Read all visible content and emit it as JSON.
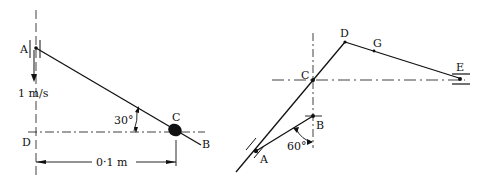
{
  "figure_left": {
    "points": {
      "A": "A",
      "B": "B",
      "C": "C",
      "D": "D"
    },
    "velocity_label": "1 m/s",
    "angle_label": "30°",
    "distance_label": "0·1 m"
  },
  "figure_right": {
    "points": {
      "A": "A",
      "B": "B",
      "C": "C",
      "D": "D",
      "G": "G",
      "E": "E"
    },
    "angle_label": "60°"
  },
  "colors": {
    "ink": "#111111",
    "background": "#ffffff"
  }
}
